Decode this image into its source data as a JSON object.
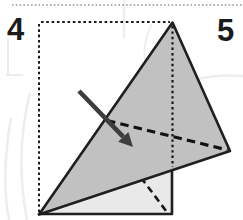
{
  "page": {
    "background": "#ffffff",
    "description_colors": {
      "paper_front": "#c1c1c1",
      "paper_back": "#e9e9e9",
      "outline": "#1f1f1f",
      "arrow": "#3d3d3d",
      "separator": "#969696",
      "watermark": "#ededed"
    }
  },
  "steps": {
    "step4_label": "4",
    "step5_label": "5"
  },
  "diagram": {
    "shapes": [
      {
        "name": "watermark-curve-left-outer",
        "type": "path",
        "attrs": {
          "d": "M 30,93 C 21,128 18,172 27,220",
          "fill": "none",
          "stroke": "#ededed",
          "stroke-width": "2.5"
        }
      },
      {
        "name": "watermark-curve-left-inner",
        "type": "path",
        "attrs": {
          "d": "M 11,118 C 5,152 3,188 9,220",
          "fill": "none",
          "stroke": "#ededed",
          "stroke-width": "2.5"
        }
      },
      {
        "name": "watermark-cross-left",
        "type": "path",
        "attrs": {
          "d": "M 8,38 L 8,74 M 6,75 L 23,75",
          "fill": "none",
          "stroke": "#ececec",
          "stroke-width": "2"
        }
      },
      {
        "name": "watermark-line-top-right",
        "type": "path",
        "attrs": {
          "d": "M 196,79 C 212,76 230,75 243,76",
          "fill": "none",
          "stroke": "#ededed",
          "stroke-width": "2.5"
        }
      },
      {
        "name": "watermark-line-top-center",
        "type": "path",
        "attrs": {
          "d": "M 124,0 L 124,38",
          "fill": "none",
          "stroke": "#efefef",
          "stroke-width": "2.5"
        }
      },
      {
        "name": "watermark-curve-apex-left",
        "type": "path",
        "attrs": {
          "d": "M 152,24 C 146,36 143,48 145,60",
          "fill": "none",
          "stroke": "#efefef",
          "stroke-width": "2"
        }
      },
      {
        "name": "panel-separator-dotted-line",
        "type": "line",
        "attrs": {
          "x1": "12",
          "y1": "5",
          "x2": "243",
          "y2": "5",
          "stroke": "#969696",
          "stroke-width": "1.5",
          "stroke-dasharray": "1.6 2.2"
        }
      },
      {
        "name": "paper-outline-square-top-dotted",
        "type": "line",
        "attrs": {
          "x1": "41",
          "y1": "22",
          "x2": "170",
          "y2": "22",
          "stroke": "#1a1a1a",
          "stroke-width": "2",
          "stroke-dasharray": "2.6 2.7"
        }
      },
      {
        "name": "paper-outline-square-left-dotted",
        "type": "line",
        "attrs": {
          "x1": "39",
          "y1": "24",
          "x2": "39",
          "y2": "212",
          "stroke": "#1a1a1a",
          "stroke-width": "2",
          "stroke-dasharray": "2.6 2.7"
        }
      },
      {
        "name": "back-layer-shape",
        "type": "polygon",
        "attrs": {
          "points": "39,214 172,214 172,169",
          "fill": "#e9e9e9",
          "stroke": "#1f1f1f",
          "stroke-width": "2.6",
          "stroke-linejoin": "round"
        }
      },
      {
        "name": "back-layer-fold-dashed-line",
        "type": "line",
        "attrs": {
          "x1": "141",
          "y1": "177.5",
          "x2": "166.5",
          "y2": "211.5",
          "stroke": "#1a1a1a",
          "stroke-width": "2.6",
          "stroke-dasharray": "7 4.5"
        }
      },
      {
        "name": "front-triangle-shape",
        "type": "polygon",
        "attrs": {
          "points": "172.5,22.5 230,151 39,214.5",
          "fill": "#c1c1c1",
          "stroke": "#1f1f1f",
          "stroke-width": "2.6",
          "stroke-linejoin": "round"
        }
      },
      {
        "name": "center-crease-dotted-line",
        "type": "line",
        "attrs": {
          "x1": "172.5",
          "y1": "26",
          "x2": "172.5",
          "y2": "167",
          "stroke": "#161616",
          "stroke-width": "2.2",
          "stroke-dasharray": "2.4 3"
        }
      },
      {
        "name": "fold-line-dashed-main",
        "type": "line",
        "attrs": {
          "x1": "107",
          "y1": "120.5",
          "x2": "227.5",
          "y2": "150",
          "stroke": "#111111",
          "stroke-width": "3.2",
          "stroke-dasharray": "8.5 5.2"
        }
      },
      {
        "name": "fold-direction-arrow-shaft",
        "type": "line",
        "attrs": {
          "x1": "79",
          "y1": "91",
          "x2": "123.3",
          "y2": "136.9",
          "stroke": "#3d3d3d",
          "stroke-width": "4.6"
        }
      },
      {
        "name": "fold-direction-arrow-head",
        "type": "polygon",
        "attrs": {
          "points": "133,147 118.2,141.7 128.4,132.1",
          "fill": "#3d3d3d"
        }
      }
    ]
  }
}
